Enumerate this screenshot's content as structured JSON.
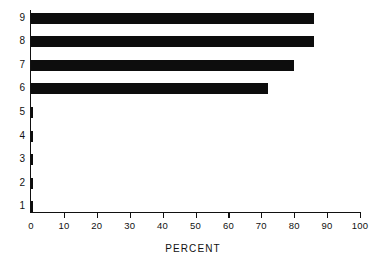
{
  "chart_data": {
    "type": "bar",
    "orientation": "horizontal",
    "title": "",
    "subtitle": "",
    "xlabel": "PERCENT",
    "ylabel": "",
    "categories": [
      "1",
      "2",
      "3",
      "4",
      "5",
      "6",
      "7",
      "8",
      "9"
    ],
    "values": [
      0.6,
      0.6,
      0.7,
      0.6,
      0.7,
      72,
      80,
      86,
      86
    ],
    "xlim": [
      0,
      100
    ],
    "xticks": [
      0,
      10,
      20,
      30,
      40,
      50,
      60,
      70,
      80,
      90,
      100
    ],
    "xtick_labels": [
      "0",
      "10",
      "20",
      "30",
      "40",
      "50",
      "60",
      "70",
      "80",
      "90",
      "100"
    ],
    "ytick_labels": [
      "9",
      "8",
      "7",
      "6",
      "5",
      "4",
      "3",
      "2",
      "1"
    ],
    "grid": false,
    "legend": null,
    "bar_color": "#0d0d0d",
    "axis_color": "#111111",
    "background": "#ffffff"
  },
  "axis_title": "PERCENT"
}
